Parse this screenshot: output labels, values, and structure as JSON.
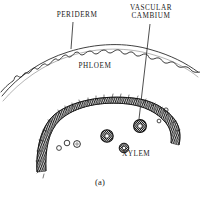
{
  "figure": {
    "kind": "botanical-cross-section-diagram",
    "caption": "(a)",
    "ink_color": "#1a1a1a",
    "background_color": "#ffffff",
    "labels": [
      {
        "id": "periderm",
        "text": "PERIDERM",
        "leader": true
      },
      {
        "id": "vascular_cambium",
        "text": "VASCULAR\nCAMBIUM",
        "leader": true
      },
      {
        "id": "phloem",
        "text": "PHLOEM",
        "leader": false
      },
      {
        "id": "xylem",
        "text": "XYLEM",
        "leader": false
      }
    ],
    "regions": [
      {
        "id": "periderm",
        "name": "Periderm",
        "style": "wavy-flaky-outer-line"
      },
      {
        "id": "phloem",
        "name": "Phloem",
        "style": "blank-band-between-arcs"
      },
      {
        "id": "vascular_cambium",
        "name": "Vascular cambium",
        "style": "thin-arc-line"
      },
      {
        "id": "xylem",
        "name": "Xylem",
        "style": "thick-hatched-band-with-vessels"
      }
    ],
    "vessels": [
      {
        "cx": 107,
        "cy": 136,
        "r": 6.2
      },
      {
        "cx": 140,
        "cy": 126,
        "r": 6.4
      },
      {
        "cx": 124,
        "cy": 148,
        "r": 4.8
      },
      {
        "cx": 77,
        "cy": 144,
        "r": 3.4
      },
      {
        "cx": 67,
        "cy": 143,
        "r": 2.8
      },
      {
        "cx": 59,
        "cy": 148,
        "r": 2.4
      },
      {
        "cx": 159,
        "cy": 121,
        "r": 1.9
      },
      {
        "cx": 166,
        "cy": 110,
        "r": 2.1
      }
    ]
  }
}
